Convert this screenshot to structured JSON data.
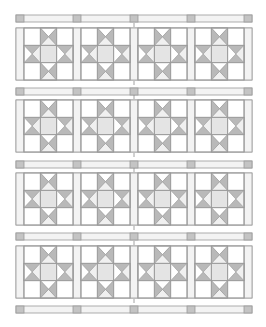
{
  "diagram": {
    "type": "quilt-layout",
    "pattern": "sawtooth-star-blocks-with-sashing",
    "rows": 4,
    "cols": 4,
    "colors": {
      "background": "#ffffff",
      "outline": "#9a9a9a",
      "sash_fill": "#f3f3f3",
      "cornerstone": "#c4c4c4",
      "star_point": "#b9b9b9",
      "star_center": "#e4e4e4",
      "light": "#ffffff",
      "tick": "#8a8a8a"
    },
    "geometry": {
      "left": 16,
      "col_pitch": 57,
      "sash_w": 8,
      "sash_rows_y": [
        15,
        88,
        161,
        233,
        306
      ],
      "sash_h": 7,
      "block_rows_y": [
        28,
        100,
        173,
        246
      ],
      "block_h": 52,
      "right": 252
    }
  }
}
